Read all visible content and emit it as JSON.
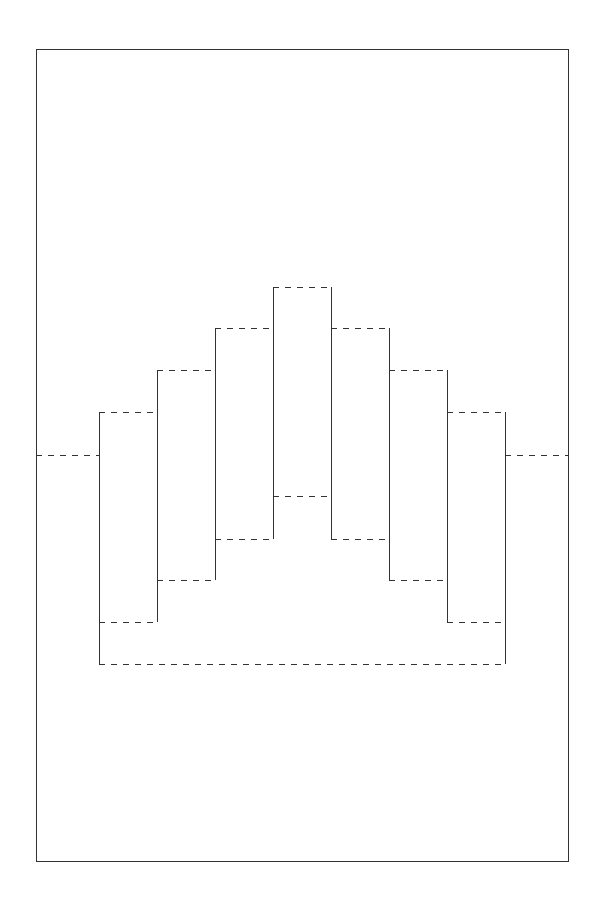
{
  "diagram": {
    "type": "pop-up card cut-and-fold template",
    "canvas": {
      "width": 596,
      "height": 907,
      "background": "#ffffff"
    },
    "line_color": "#333333",
    "legend": {
      "solid": "cut line",
      "dashed": "fold line"
    },
    "frame": {
      "x": 36,
      "y": 49,
      "width": 532,
      "height": 812
    },
    "center_fold": {
      "y": 455
    },
    "column_edges_x": [
      99,
      157,
      215,
      273,
      331,
      389,
      447,
      505
    ],
    "steps": [
      {
        "name": "column-1",
        "x1": 99,
        "x2": 157,
        "top": 412,
        "bottom": 622
      },
      {
        "name": "column-2",
        "x1": 157,
        "x2": 215,
        "top": 370,
        "bottom": 580
      },
      {
        "name": "column-3",
        "x1": 215,
        "x2": 273,
        "top": 328,
        "bottom": 539
      },
      {
        "name": "column-4",
        "x1": 273,
        "x2": 331,
        "top": 287,
        "bottom": 496
      },
      {
        "name": "column-5",
        "x1": 331,
        "x2": 389,
        "top": 328,
        "bottom": 539
      },
      {
        "name": "column-6",
        "x1": 389,
        "x2": 447,
        "top": 370,
        "bottom": 580
      },
      {
        "name": "column-7",
        "x1": 447,
        "x2": 505,
        "top": 412,
        "bottom": 622
      }
    ],
    "base_fold": {
      "x1": 99,
      "x2": 505,
      "y": 664
    }
  }
}
